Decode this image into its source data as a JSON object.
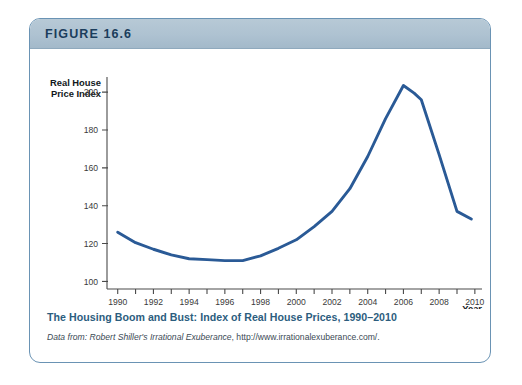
{
  "figure": {
    "number_label": "FIGURE 16.6",
    "caption_title": "The Housing Boom and Bust: Index of Real House Prices, 1990–2010",
    "source_prefix": "Data from: Robert Shiller's ",
    "source_italic": "Irrational Exuberance",
    "source_suffix": ", http://www.irrationalexuberance.com/."
  },
  "colors": {
    "line": "#2a5a96",
    "header_band": "#aec2d1",
    "card_border": "#6a93b4",
    "caption_title": "#2c5d7e",
    "axis": "#4a4a4a"
  },
  "chart_data": {
    "type": "line",
    "title": "The Housing Boom and Bust: Index of Real House Prices, 1990–2010",
    "xlabel": "Year",
    "ylabel": "Real House Price Index",
    "ylabel_line1": "Real House",
    "ylabel_line2": "Price Index",
    "xlim": [
      1989.4,
      2010.4
    ],
    "ylim": [
      96,
      208
    ],
    "yticks": [
      100,
      120,
      140,
      160,
      180,
      200
    ],
    "ytick_labels": [
      "100",
      "120",
      "140",
      "160",
      "180",
      "200"
    ],
    "xticks": [
      1990,
      1991,
      1992,
      1993,
      1994,
      1995,
      1996,
      1997,
      1998,
      1999,
      2000,
      2001,
      2002,
      2003,
      2004,
      2005,
      2006,
      2007,
      2008,
      2009,
      2010
    ],
    "xtick_labels_shown": [
      "1990",
      "1992",
      "1994",
      "1996",
      "1998",
      "2000",
      "2002",
      "2004",
      "2006",
      "2008",
      "2010"
    ],
    "xtick_label_years": [
      1990,
      1992,
      1994,
      1996,
      1998,
      2000,
      2002,
      2004,
      2006,
      2008,
      2010
    ],
    "grid": false,
    "legend": false,
    "series": [
      {
        "name": "Real House Price Index",
        "color": "#2a5a96",
        "x": [
          1990,
          1991,
          1992,
          1993,
          1994,
          1995,
          1996,
          1997,
          1998,
          1999,
          2000,
          2001,
          2002,
          2003,
          2004,
          2005,
          2006,
          2006.6,
          2007,
          2008,
          2009,
          2009.8
        ],
        "values": [
          126,
          120.5,
          117,
          114,
          112,
          111.5,
          111,
          111,
          113.5,
          117.5,
          122,
          129,
          137,
          149,
          166,
          186,
          203.5,
          199.5,
          196,
          167,
          137,
          133
        ]
      }
    ]
  }
}
